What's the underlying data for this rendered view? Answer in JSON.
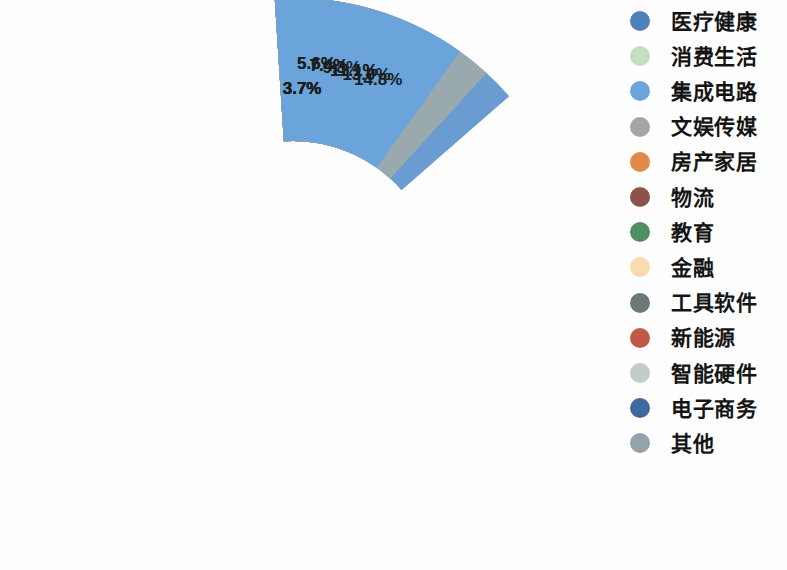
{
  "chart_data": {
    "type": "pie",
    "variant": "donut",
    "title": "",
    "subtitle": "",
    "xlabel": "",
    "ylabel": "",
    "units": "%",
    "value_label_suffix": "%",
    "legend_position": "right",
    "grid": false,
    "total": 100.0,
    "start_angle_deg": -4,
    "direction": "clockwise",
    "categories": [
      "消费生活",
      "医疗健康",
      "其他",
      "电子商务",
      "智能硬件",
      "新能源",
      "工具软件",
      "金融",
      "教育",
      "物流",
      "房产家居",
      "文娱传媒",
      "集成电路"
    ],
    "values": [
      11.1,
      14.8,
      13.0,
      3.7,
      3.7,
      3.7,
      3.7,
      5.6,
      5.6,
      7.4,
      7.4,
      9.3,
      11.1
    ],
    "value_labels": [
      "11.1%",
      "14.8%",
      "13.0%",
      "3.7%",
      "3.7%",
      "3.7%",
      "3.7%",
      "5.6%",
      "5.6%",
      "7.4%",
      "7.4%",
      "9.3%",
      "11.1%"
    ],
    "colors": [
      "#b6ddb0",
      "#6a9bd1",
      "#9aa9ae",
      "#4a74a5",
      "#cdd4d2",
      "#c4786a",
      "#6f7a7d",
      "#f3dcba",
      "#5da377",
      "#8d5f55",
      "#e09a5c",
      "#a8a9a6",
      "#6aa4da"
    ]
  },
  "legend": {
    "items": [
      {
        "label": "医疗健康",
        "color": "#4f7fbf"
      },
      {
        "label": "消费生活",
        "color": "#c3e0bd"
      },
      {
        "label": "集成电路",
        "color": "#6aa4da"
      },
      {
        "label": "文娱传媒",
        "color": "#a3a6a3"
      },
      {
        "label": "房产家居",
        "color": "#e08a4a"
      },
      {
        "label": "物流",
        "color": "#8d5248"
      },
      {
        "label": "教育",
        "color": "#4f8f5f"
      },
      {
        "label": "金融",
        "color": "#fadbb0"
      },
      {
        "label": "工具软件",
        "color": "#6d7678"
      },
      {
        "label": "新能源",
        "color": "#c05a47"
      },
      {
        "label": "智能硬件",
        "color": "#c3cbcb"
      },
      {
        "label": "电子商务",
        "color": "#3f6b9c"
      },
      {
        "label": "其他",
        "color": "#93a3ab"
      }
    ]
  }
}
